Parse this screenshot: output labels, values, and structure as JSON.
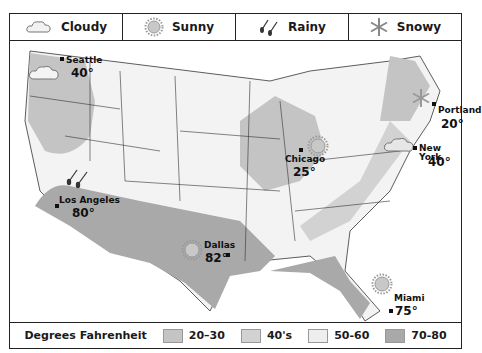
{
  "weather_legend": [
    {
      "label": "Cloudy",
      "icon": "cloud-icon"
    },
    {
      "label": "Sunny",
      "icon": "sun-icon"
    },
    {
      "label": "Rainy",
      "icon": "rain-icon"
    },
    {
      "label": "Snowy",
      "icon": "snowflake-icon"
    }
  ],
  "temperature_legend": {
    "title": "Degrees Fahrenheit",
    "items": [
      {
        "label": "20–30",
        "color": "#c4c4c4"
      },
      {
        "label": "40's",
        "color": "#d2d2d2"
      },
      {
        "label": "50-60",
        "color": "#eeeeee"
      },
      {
        "label": "70-80",
        "color": "#a9a9a9"
      }
    ]
  },
  "cities": [
    {
      "name": "Seattle",
      "temp": "40°",
      "weather": "cloudy"
    },
    {
      "name": "Los Angeles",
      "temp": "80°",
      "weather": "rainy"
    },
    {
      "name": "Dallas",
      "temp": "82°",
      "weather": "sunny"
    },
    {
      "name": "Chicago",
      "temp": "25°",
      "weather": "sunny"
    },
    {
      "name": "Portland",
      "temp": "20°",
      "weather": "snowy"
    },
    {
      "name": "New York",
      "temp": "40°",
      "weather": "cloudy"
    },
    {
      "name": "Miami",
      "temp": "75°",
      "weather": "sunny"
    }
  ]
}
